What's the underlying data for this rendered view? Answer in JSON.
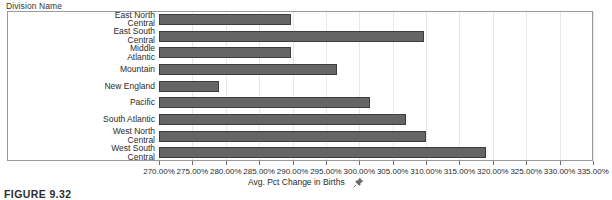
{
  "header": {
    "dimension_label": "Division Name"
  },
  "caption": {
    "figure_label": "FIGURE 9.32"
  },
  "axis": {
    "title": "Avg. Pct Change in Births",
    "title_icon": "pushpin-icon",
    "tick_labels": [
      "270.00%",
      "275.00%",
      "280.00%",
      "285.00%",
      "290.00%",
      "295.00%",
      "300.00%",
      "305.00%",
      "310.00%",
      "315.00%",
      "320.00%",
      "325.00%",
      "330.00%",
      "335.00%"
    ]
  },
  "colors": {
    "bar_fill": "#656565",
    "bar_border": "#3d3d3d",
    "frame": "#9a9a9a",
    "gridline": "#e8e8e8",
    "text": "#2b2b2b"
  },
  "chart_data": {
    "type": "bar",
    "orientation": "horizontal",
    "title": "",
    "xlabel": "Avg. Pct Change in Births",
    "ylabel": "Division Name",
    "xlim": [
      270.0,
      335.0
    ],
    "xtick_step": 5.0,
    "xtick_format": "percent",
    "grid": true,
    "legend": "none",
    "categories": [
      "East North Central",
      "East South Central",
      "Middle Atlantic",
      "Mountain",
      "New England",
      "Pacific",
      "South Atlantic",
      "West North Central",
      "West South Central"
    ],
    "category_labels_wrapped": [
      "East North\nCentral",
      "East South\nCentral",
      "Middle\nAtlantic",
      "Mountain",
      "New England",
      "Pacific",
      "South Atlantic",
      "West North\nCentral",
      "West South\nCentral"
    ],
    "values": [
      289.9,
      309.8,
      289.9,
      296.8,
      279.1,
      301.7,
      307.1,
      310.0,
      319.1
    ],
    "value_labels": [
      "289.90%",
      "309.80%",
      "289.90%",
      "296.80%",
      "279.10%",
      "301.70%",
      "307.10%",
      "310.00%",
      "319.10%"
    ]
  }
}
